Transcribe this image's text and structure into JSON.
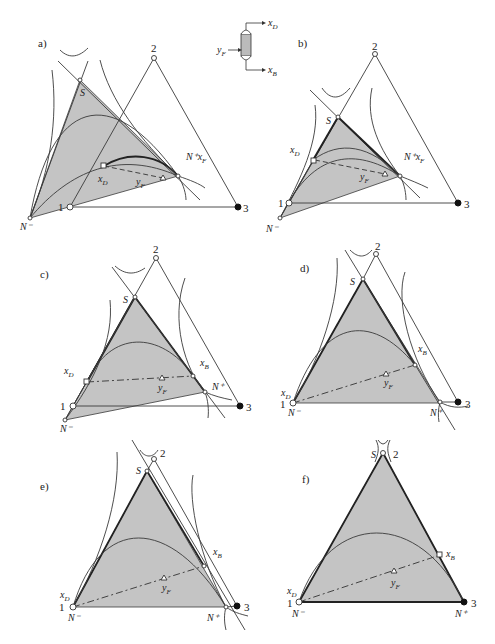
{
  "figure": {
    "panels": [
      {
        "id": "a",
        "label": "a)",
        "vertices": {
          "v1": "1",
          "v2": "2",
          "v3": "3"
        },
        "points": {
          "S": "S",
          "N_minus": "N⁻",
          "N_plus_xF": "N⁺x",
          "xD": "x",
          "yF": "y"
        }
      },
      {
        "id": "b",
        "label": "b)",
        "vertices": {
          "v1": "1",
          "v2": "2",
          "v3": "3"
        },
        "points": {
          "S": "S",
          "N_minus": "N⁻",
          "N_plus_xF": "N⁺x",
          "xD": "x",
          "yF": "y"
        }
      },
      {
        "id": "c",
        "label": "c)",
        "vertices": {
          "v1": "1",
          "v2": "2",
          "v3": "3"
        },
        "points": {
          "S": "S",
          "N_minus": "N⁻",
          "N_plus": "N⁺",
          "xD": "x",
          "xB": "x",
          "yF": "y"
        }
      },
      {
        "id": "d",
        "label": "d)",
        "vertices": {
          "v1": "1",
          "v2": "2",
          "v3": "3"
        },
        "points": {
          "S": "S",
          "N_minus": "N⁻",
          "N_plus": "N⁺",
          "xD": "x",
          "xB": "x",
          "yF": "y"
        }
      },
      {
        "id": "e",
        "label": "e)",
        "vertices": {
          "v1": "1",
          "v2": "2",
          "v3": "3"
        },
        "points": {
          "S": "S",
          "N_minus": "N⁻",
          "N_plus": "N⁺",
          "xD": "x",
          "xB": "x",
          "yF": "y"
        }
      },
      {
        "id": "f",
        "label": "f)",
        "vertices": {
          "v1": "1",
          "v2": "2",
          "v3": "3"
        },
        "points": {
          "S": "S",
          "N_minus": "N⁻",
          "N_plus": "N⁺",
          "xD": "x",
          "xB": "x",
          "yF": "y"
        }
      }
    ],
    "column_icon": {
      "feed": "y",
      "distillate": "x",
      "bottoms": "x"
    },
    "subscripts": {
      "D": "D",
      "B": "B",
      "F": "F"
    }
  }
}
